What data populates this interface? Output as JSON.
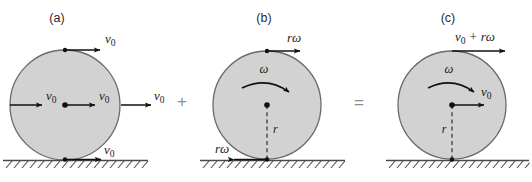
{
  "figure": {
    "background_color": "#ffffff",
    "disk_fill": "#d2d2d2",
    "disk_stroke": "#6a6a6a",
    "arrow_color": "#111111",
    "ground_color": "#4a4a4a",
    "operator_color": "#8d8d8d"
  },
  "operators": {
    "plus": "+",
    "equals": "="
  },
  "panels": [
    {
      "id": "a",
      "label": "(a)",
      "caption": "pure translation",
      "center_dot": true,
      "radius_label": "",
      "omega_label": "",
      "arrows": [
        {
          "name": "top-velocity",
          "label_main": "v",
          "label_sub": "0",
          "direction": "right"
        },
        {
          "name": "left-velocity",
          "label_main": "v",
          "label_sub": "0",
          "direction": "right"
        },
        {
          "name": "center-velocity",
          "label_main": "v",
          "label_sub": "0",
          "direction": "right"
        },
        {
          "name": "right-velocity",
          "label_main": "v",
          "label_sub": "0",
          "direction": "right"
        },
        {
          "name": "bottom-velocity",
          "label_main": "v",
          "label_sub": "0",
          "direction": "right"
        }
      ]
    },
    {
      "id": "b",
      "label": "(b)",
      "caption": "pure rotation",
      "center_dot": true,
      "radius_label": "r",
      "omega_label": "ω",
      "arrows": [
        {
          "name": "top-velocity",
          "label_main": "rω",
          "label_sub": "",
          "direction": "right"
        },
        {
          "name": "bottom-velocity",
          "label_main": "rω",
          "label_sub": "",
          "direction": "left"
        }
      ]
    },
    {
      "id": "c",
      "label": "(c)",
      "caption": "combined rolling motion",
      "center_dot": true,
      "radius_label": "r",
      "omega_label": "ω",
      "arrows": [
        {
          "name": "top-velocity",
          "label_main": "v",
          "label_sub": "0",
          "label_tail": " + rω",
          "direction": "right"
        },
        {
          "name": "center-velocity",
          "label_main": "v",
          "label_sub": "0",
          "direction": "right"
        }
      ]
    }
  ]
}
